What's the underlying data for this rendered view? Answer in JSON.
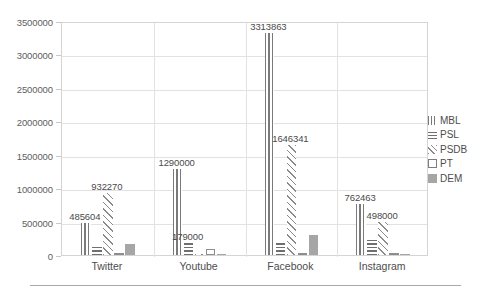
{
  "chart_data": {
    "type": "bar",
    "title": "",
    "xlabel": "",
    "ylabel": "",
    "ylim": [
      0,
      3500000
    ],
    "ytick_step": 500000,
    "grid": true,
    "legend_position": "right",
    "categories": [
      "Twitter",
      "Youtube",
      "Facebook",
      "Instagram"
    ],
    "ytick_labels": [
      "3500000",
      "3000000",
      "2500000",
      "2000000",
      "1500000",
      "1000000",
      "500000",
      "0"
    ],
    "ytick_values": [
      3500000,
      3000000,
      2500000,
      2000000,
      1500000,
      1000000,
      500000,
      0
    ],
    "series": [
      {
        "name": "MBL",
        "pattern": "vertical-lines",
        "values": [
          485604,
          1290000,
          3313863,
          762463
        ],
        "labels": [
          "485604",
          "1290000",
          "3313863",
          "762463"
        ]
      },
      {
        "name": "PSL",
        "pattern": "horizontal-lines",
        "values": [
          150000,
          179000,
          200000,
          250000
        ],
        "labels": [
          "",
          "179000",
          "",
          ""
        ]
      },
      {
        "name": "PSDB",
        "pattern": "diagonal-hatch",
        "values": [
          932270,
          20000,
          1646341,
          498000
        ],
        "labels": [
          "932270",
          "",
          "1646341",
          "498000"
        ]
      },
      {
        "name": "PT",
        "pattern": "empty-outline",
        "values": [
          20000,
          90000,
          15000,
          15000
        ],
        "labels": [
          "",
          "",
          "",
          ""
        ]
      },
      {
        "name": "DEM",
        "pattern": "solid-fill",
        "values": [
          165000,
          10000,
          300000,
          10000
        ],
        "labels": [
          "",
          "",
          "",
          ""
        ]
      }
    ]
  },
  "legend": {
    "items": [
      {
        "label": "MBL",
        "pattern": "vertical-lines"
      },
      {
        "label": "PSL",
        "pattern": "horizontal-lines"
      },
      {
        "label": "PSDB",
        "pattern": "diagonal-hatch"
      },
      {
        "label": "PT",
        "pattern": "empty-outline"
      },
      {
        "label": "DEM",
        "pattern": "solid-fill"
      }
    ]
  },
  "colors": {
    "plot_border": "#d4d4d4",
    "gridline": "#e2e2e2",
    "text": "#4d4d4d",
    "dem_fill": "#a6a6a6",
    "hatch_stroke": "#7a7a7a"
  }
}
